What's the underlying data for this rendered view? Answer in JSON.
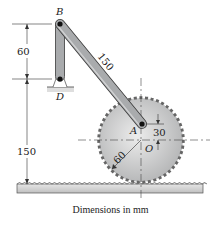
{
  "diagram": {
    "type": "mechanism",
    "points": {
      "B": {
        "label": "B"
      },
      "D": {
        "label": "D"
      },
      "A": {
        "label": "A"
      },
      "O": {
        "label": "O"
      }
    },
    "dimensions": {
      "BD_height": "60",
      "BA_length": "150",
      "D_to_rack": "150",
      "OA_offset": "30",
      "gear_radius": "60"
    },
    "caption": "Dimensions in mm",
    "colors": {
      "link_fill": "#a7a9ab",
      "link_stroke": "#3a3a3a",
      "gear_fill": "#c9cacb",
      "rack_fill": "#d4d5d6",
      "ground_fill": "#dcdcdc",
      "line": "#333333"
    }
  }
}
